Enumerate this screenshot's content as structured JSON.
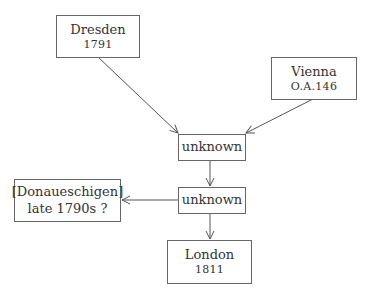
{
  "nodes": {
    "dresden": {
      "name": "Dresden",
      "date": "1791"
    },
    "vienna": {
      "name": "Vienna",
      "date": "O.A.146"
    },
    "unknown1": {
      "name": "unknown"
    },
    "unknown2": {
      "name": "unknown"
    },
    "donaueschingen": {
      "name": "[Donaueschigen]",
      "date": "late 1790s ?"
    },
    "london": {
      "name": "London",
      "date": "1811"
    }
  },
  "edges": [
    {
      "from": "dresden",
      "to": "unknown1"
    },
    {
      "from": "vienna",
      "to": "unknown1"
    },
    {
      "from": "unknown1",
      "to": "unknown2"
    },
    {
      "from": "unknown2",
      "to": "donaueschingen"
    },
    {
      "from": "unknown2",
      "to": "london"
    }
  ]
}
